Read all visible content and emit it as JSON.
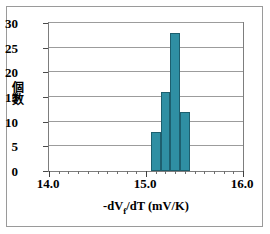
{
  "chart_data": {
    "type": "bar",
    "title": "",
    "subtitle": "",
    "xlabel": "-dVf/dT (mV/K)",
    "xlabel_prefix": "-dV",
    "xlabel_subscript": "f",
    "xlabel_suffix": "/dT (mV/K)",
    "ylabel": "個数",
    "ylabel_chars": [
      "個",
      "数"
    ],
    "xlim": [
      14.0,
      16.0
    ],
    "ylim": [
      0,
      30
    ],
    "grid": "horizontal",
    "legend": "none",
    "bar_color": "#2f8fa3",
    "bar_edge_color": "#1d5f6e",
    "x_major_ticks": [
      "14.0",
      "15.0",
      "16.0"
    ],
    "x_major_tick_values": [
      14.0,
      15.0,
      16.0
    ],
    "x_minor_tick_step": 0.1,
    "y_ticks": [
      "0",
      "5",
      "10",
      "15",
      "20",
      "25",
      "30"
    ],
    "y_tick_values": [
      0,
      5,
      10,
      15,
      20,
      25,
      30
    ],
    "bin_width": 0.1,
    "bins": [
      {
        "x_left": 15.05,
        "x_right": 15.15,
        "center": 15.1,
        "count": 8
      },
      {
        "x_left": 15.15,
        "x_right": 15.25,
        "center": 15.2,
        "count": 16
      },
      {
        "x_left": 15.25,
        "x_right": 15.35,
        "center": 15.3,
        "count": 28
      },
      {
        "x_left": 15.35,
        "x_right": 15.45,
        "center": 15.4,
        "count": 12
      }
    ],
    "categories": [
      "15.10",
      "15.20",
      "15.30",
      "15.40"
    ],
    "values": [
      8,
      16,
      28,
      12
    ]
  },
  "figure": {
    "background": "#ffffff",
    "frame_color": "#9a9a9a",
    "axis_color": "#7d7d7d",
    "gridline_color": "#9c9c9c"
  }
}
